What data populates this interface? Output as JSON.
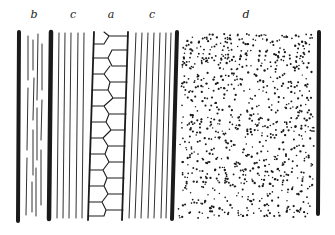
{
  "figure": {
    "type": "histological tissue diagram",
    "labels": [
      {
        "id": "b",
        "text": "b",
        "x": 34
      },
      {
        "id": "c1",
        "text": "c",
        "x": 73
      },
      {
        "id": "a",
        "text": "a",
        "x": 111
      },
      {
        "id": "c2",
        "text": "c",
        "x": 152
      },
      {
        "id": "d",
        "text": "d",
        "x": 246
      }
    ],
    "regions": [
      {
        "id": "b",
        "desc": "region with short broken streaks"
      },
      {
        "id": "c",
        "desc": "fibrous region with parallel lines"
      },
      {
        "id": "a",
        "desc": "column of hexagonal cells"
      },
      {
        "id": "d",
        "desc": "granular stippled region"
      }
    ],
    "ink_color": "#1a1a1a",
    "background": "#ffffff"
  }
}
